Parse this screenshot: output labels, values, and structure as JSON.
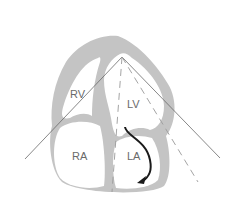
{
  "diagram": {
    "type": "apical four-chamber echocardiographic view",
    "chambers": [
      {
        "id": "rv",
        "label": "RV"
      },
      {
        "id": "lv",
        "label": "LV"
      },
      {
        "id": "ra",
        "label": "RA"
      },
      {
        "id": "la",
        "label": "LA"
      }
    ],
    "colors": {
      "myocardium": "#c4c4c4",
      "cavity": "#ffffff",
      "scan_line": "#6a6a6a",
      "arrow": "#1a1a1a"
    }
  }
}
